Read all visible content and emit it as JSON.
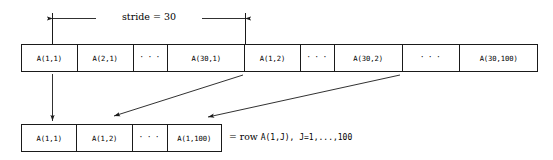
{
  "figure": {
    "stride_label": "stride = 30",
    "colors": {
      "line": "#1a1a1a",
      "background": "#ffffff",
      "text": "#000000"
    }
  },
  "memory_row": {
    "name": "linear-memory-layout",
    "cells": [
      {
        "label": "A(1,1)",
        "kind": "value",
        "width": 56
      },
      {
        "label": "A(2,1)",
        "kind": "value",
        "width": 56
      },
      {
        "label": "· · ·",
        "kind": "ellipsis",
        "width": 35
      },
      {
        "label": "A(30,1)",
        "kind": "value",
        "width": 77
      },
      {
        "label": "A(1,2)",
        "kind": "value",
        "width": 56
      },
      {
        "label": "· · ·",
        "kind": "ellipsis",
        "width": 34
      },
      {
        "label": "A(30,2)",
        "kind": "value",
        "width": 68
      },
      {
        "label": "· · ·",
        "kind": "ellipsis",
        "width": 58
      },
      {
        "label": "A(30,100)",
        "kind": "value",
        "width": 77
      }
    ]
  },
  "row_vector": {
    "name": "extracted-row-vector",
    "cells": [
      {
        "label": "A(1,1)",
        "kind": "value",
        "width": 56
      },
      {
        "label": "A(1,2)",
        "kind": "value",
        "width": 56
      },
      {
        "label": "· · ·",
        "kind": "ellipsis",
        "width": 35
      },
      {
        "label": "A(1,100)",
        "kind": "value",
        "width": 54
      }
    ]
  },
  "annotations": {
    "row_equation_prefix": "= row ",
    "row_equation_expr": "A(1,J), J=1,...,100"
  },
  "arrows": [
    {
      "name": "arrow-a11-down",
      "from_cell": "A(1,1)",
      "to_cell": "A(1,1)",
      "type": "vertical"
    },
    {
      "name": "arrow-a12-diagonal",
      "from_cell": "A(1,2)",
      "to_cell": "A(1,2)",
      "type": "diagonal"
    },
    {
      "name": "arrow-a1100-diagonal",
      "from_cell": "A(1,100)",
      "to_cell": "A(1,100)",
      "type": "diagonal"
    }
  ]
}
